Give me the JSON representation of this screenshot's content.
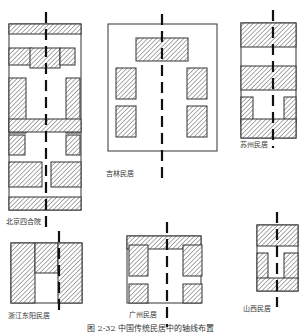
{
  "figure": {
    "caption": "图 2-32  中国传统民居中的轴线布置",
    "colors": {
      "stroke": "#333333",
      "hatch": "#555555",
      "background": "#ffffff"
    },
    "hatch_legend": "diagonal-hatch = built mass (buildings)",
    "plans": [
      {
        "id": "beijing",
        "label": "北京四合院",
        "label_pos": [
          6,
          219
        ],
        "outline": [
          9,
          24,
          72,
          186
        ],
        "blocks": [
          [
            9,
            24,
            72,
            10
          ],
          [
            9,
            48,
            22,
            17
          ],
          [
            30,
            48,
            30,
            20
          ],
          [
            60,
            48,
            15,
            17
          ],
          [
            9,
            78,
            17,
            55
          ],
          [
            66,
            78,
            14,
            55
          ],
          [
            9,
            119,
            72,
            13
          ],
          [
            9,
            135,
            16,
            20
          ],
          [
            66,
            135,
            14,
            20
          ],
          [
            9,
            162,
            33,
            25
          ],
          [
            51,
            162,
            30,
            25
          ],
          [
            9,
            197,
            72,
            13
          ]
        ],
        "axis": {
          "x": 46,
          "y1": 12,
          "y2": 228
        }
      },
      {
        "id": "jilin",
        "label": "吉林民居",
        "label_pos": [
          106,
          171
        ],
        "outline": [
          108,
          24,
          109,
          127
        ],
        "blocks": [
          [
            136,
            38,
            52,
            23
          ],
          [
            116,
            68,
            20,
            31
          ],
          [
            187,
            68,
            20,
            31
          ],
          [
            116,
            106,
            20,
            31
          ],
          [
            187,
            106,
            20,
            31
          ]
        ],
        "axis": {
          "x": 162,
          "y1": 14,
          "y2": 183
        }
      },
      {
        "id": "suzhou",
        "label": "苏州民居",
        "label_pos": [
          240,
          142
        ],
        "outline": [
          241,
          23,
          55,
          115
        ],
        "blocks": [
          [
            241,
            23,
            55,
            24
          ],
          [
            241,
            66,
            55,
            24
          ],
          [
            241,
            97,
            12,
            27
          ],
          [
            284,
            97,
            12,
            27
          ],
          [
            241,
            119,
            55,
            19
          ]
        ],
        "axis": {
          "x": 273,
          "y1": 10,
          "y2": 148
        }
      },
      {
        "id": "zhejiang",
        "label": "浙江东阳民居",
        "label_pos": [
          8,
          313
        ],
        "outline": [
          11,
          243,
          71,
          60
        ],
        "blocks": [
          [
            11,
            243,
            24,
            60
          ],
          [
            35,
            243,
            23,
            30
          ],
          [
            58,
            243,
            24,
            60
          ]
        ],
        "axis": {
          "x": 59,
          "y1": 231,
          "y2": 316
        }
      },
      {
        "id": "guangzhou",
        "label": "广州民居",
        "label_pos": [
          129,
          312
        ],
        "outline": [
          127,
          236,
          74,
          67
        ],
        "blocks": [
          [
            127,
            236,
            74,
            13
          ],
          [
            129,
            245,
            19,
            31
          ],
          [
            183,
            245,
            19,
            31
          ],
          [
            129,
            284,
            19,
            19
          ],
          [
            183,
            284,
            19,
            19
          ]
        ],
        "axis": {
          "x": 167,
          "y1": 222,
          "y2": 327
        }
      },
      {
        "id": "shanxi",
        "label": "山西民居",
        "label_pos": [
          243,
          306
        ],
        "outline": [
          257,
          225,
          41,
          66
        ],
        "blocks": [
          [
            257,
            225,
            41,
            21
          ],
          [
            257,
            253,
            11,
            26
          ],
          [
            284,
            253,
            14,
            26
          ],
          [
            257,
            278,
            41,
            13
          ]
        ],
        "axis": {
          "x": 277,
          "y1": 212,
          "y2": 307
        }
      }
    ]
  },
  "caption_pos": [
    87,
    325
  ]
}
